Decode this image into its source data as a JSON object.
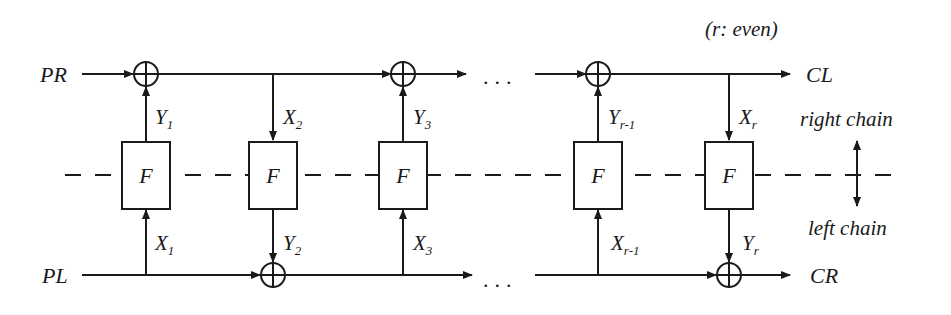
{
  "diagram": {
    "note": "(r: even)",
    "inputs": {
      "top": "PR",
      "bottom": "PL"
    },
    "outputs": {
      "top": "CL",
      "bottom": "CR"
    },
    "function_label": "F",
    "ellipsis": "...",
    "chain_labels": {
      "right": "right chain",
      "left": "left chain"
    },
    "rounds": [
      {
        "col": 1,
        "top_var": "Y",
        "top_sub": "1",
        "bottom_var": "X",
        "bottom_sub": "1",
        "direction": "up"
      },
      {
        "col": 2,
        "top_var": "X",
        "top_sub": "2",
        "bottom_var": "Y",
        "bottom_sub": "2",
        "direction": "down"
      },
      {
        "col": 3,
        "top_var": "Y",
        "top_sub": "3",
        "bottom_var": "X",
        "bottom_sub": "3",
        "direction": "up"
      },
      {
        "col": 4,
        "top_var": "Y",
        "top_sub": "r-1",
        "bottom_var": "X",
        "bottom_sub": "r-1",
        "direction": "up"
      },
      {
        "col": 5,
        "top_var": "X",
        "top_sub": "r",
        "bottom_var": "Y",
        "bottom_sub": "r",
        "direction": "down"
      }
    ]
  }
}
